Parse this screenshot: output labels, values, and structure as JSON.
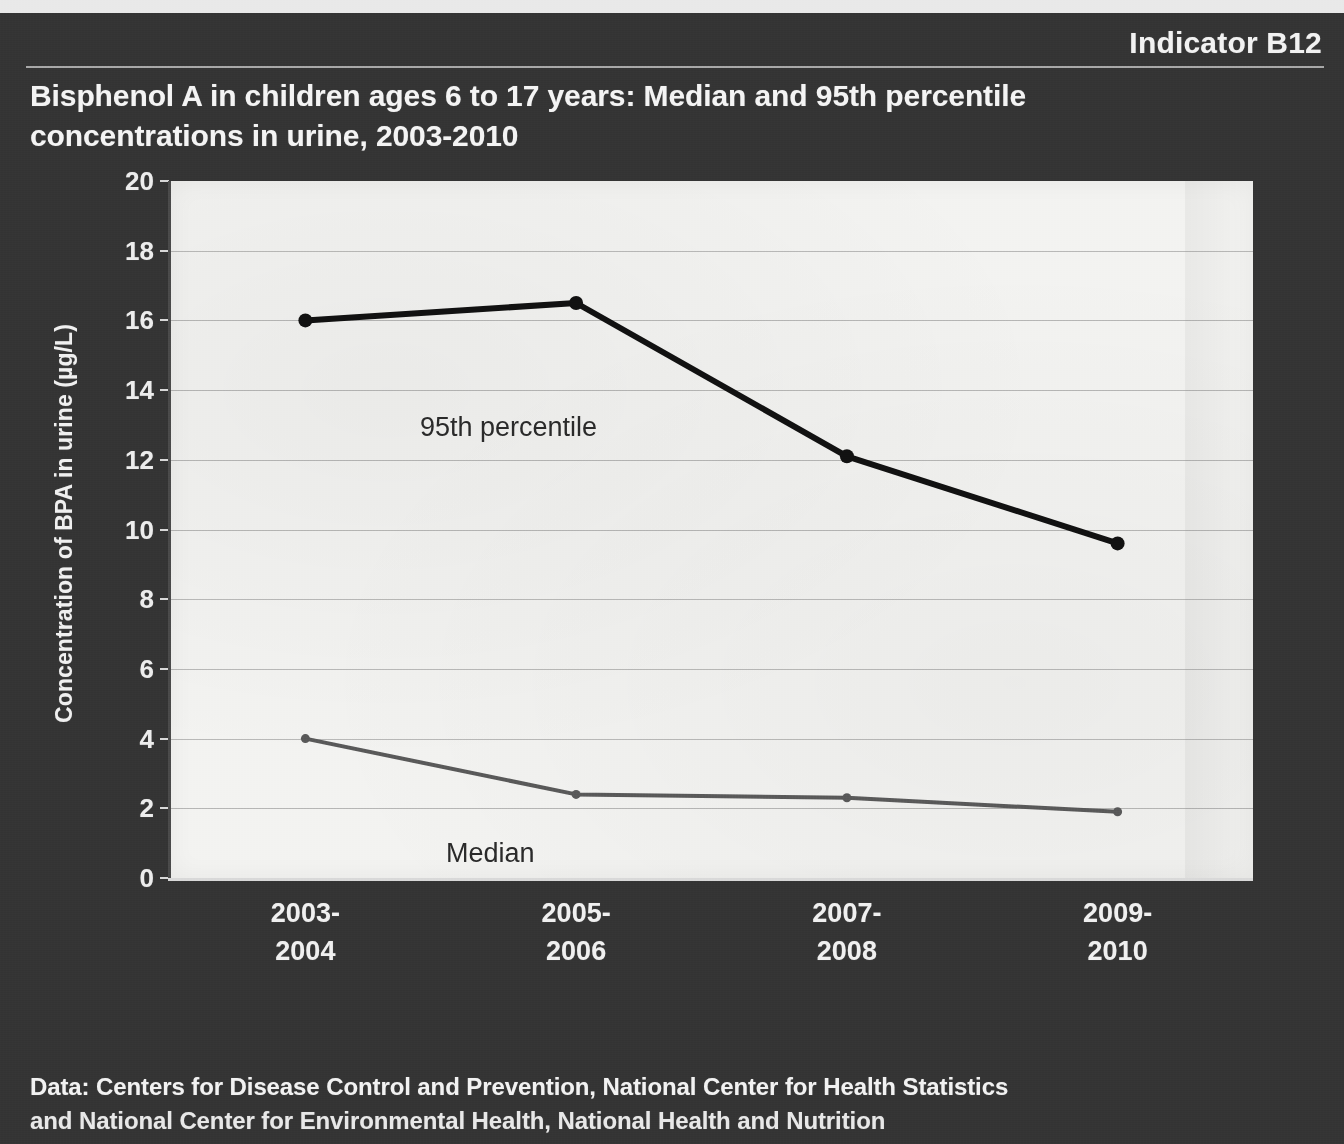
{
  "header": {
    "indicator_label": "Indicator B12",
    "title": "Bisphenol A in children ages 6 to 17 years: Median and 95th percentile concentrations in urine, 2003-2010"
  },
  "footer": {
    "line1": "Data: Centers for Disease Control and Prevention, National Center for Health Statistics",
    "line2": "and National Center for Environmental Health, National Health and Nutrition"
  },
  "colors": {
    "slide_background": "#343434",
    "plot_background": "#f3f3f1",
    "text": "#f2f2f2",
    "series_95th": "#111111",
    "series_median": "#595959",
    "gridline": "#6e6e6e"
  },
  "chart_data": {
    "type": "line",
    "title": "Bisphenol A in children ages 6 to 17 years: Median and 95th percentile concentrations in urine, 2003-2010",
    "xlabel": "",
    "ylabel": "Concentration of BPA in urine (µg/L)",
    "categories": [
      "2003-2004",
      "2005-2006",
      "2007-2008",
      "2009-2010"
    ],
    "category_lines": [
      [
        "2003-",
        "2004"
      ],
      [
        "2005-",
        "2006"
      ],
      [
        "2007-",
        "2008"
      ],
      [
        "2009-",
        "2010"
      ]
    ],
    "ylim": [
      0,
      20
    ],
    "ytick_step": 2,
    "yticks": [
      20,
      18,
      16,
      14,
      12,
      10,
      8,
      6,
      4,
      2,
      0
    ],
    "grid": true,
    "grid_axis": "y",
    "legend": "inline-labels",
    "series": [
      {
        "name": "95th percentile",
        "color": "#111111",
        "values": [
          16.0,
          16.5,
          12.1,
          9.6
        ],
        "label_text": "95th percentile"
      },
      {
        "name": "Median",
        "color": "#595959",
        "values": [
          4.0,
          2.4,
          2.3,
          1.9
        ],
        "label_text": "Median"
      }
    ]
  }
}
